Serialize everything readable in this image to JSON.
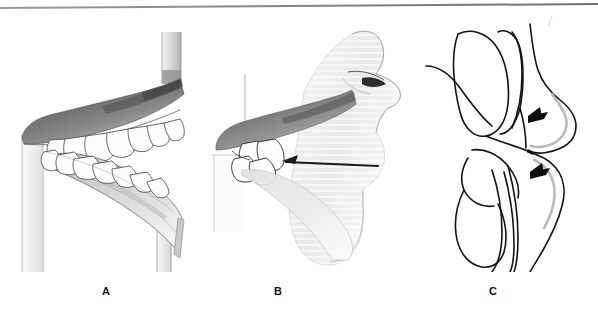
{
  "figure": {
    "background_color": "#ffffff",
    "rule_color": "#7d7d7d",
    "watermark_text": "...........  ......",
    "tick_glyph": "/"
  },
  "panels": [
    {
      "id": "panel-a",
      "caption": "A",
      "kind": "pencil-rendering",
      "description": "Lateral pencil rendering of maxillary and mandibular dentition in occlusion with vertical reference planes",
      "ink_color": "#3b3b3b",
      "shade_color": "#6f6f6f",
      "arrows": []
    },
    {
      "id": "panel-b",
      "caption": "B",
      "kind": "pencil-rendering",
      "description": "Same dentition with facial soft-tissue profile overlay showing nose, lips and chin; horizontal lip-line arrow pointing left",
      "ink_color": "#3b3b3b",
      "shade_color": "#9a9a9a",
      "arrows": [
        {
          "name": "lip-line-arrow",
          "direction": "left",
          "label": ""
        }
      ]
    },
    {
      "id": "panel-c",
      "caption": "C",
      "kind": "line-drawing",
      "description": "Schematic line drawing of incisors and soft-tissue contour with two arrows indicating upper and lower lip positions",
      "ink_color": "#111111",
      "shade_color": "#d8d8d8",
      "arrows": [
        {
          "name": "upper-lip-arrow",
          "direction": "left",
          "label": ""
        },
        {
          "name": "lower-lip-arrow",
          "direction": "left",
          "label": ""
        }
      ]
    }
  ],
  "captions": {
    "a": "A",
    "b": "B",
    "c": "C"
  }
}
